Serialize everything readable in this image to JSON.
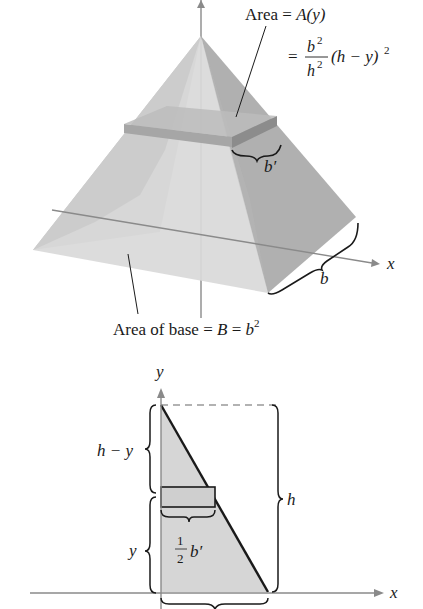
{
  "figure": {
    "top_diagram": {
      "title": "Square pyramid with cross-section slice",
      "area_label": "Area = A(y)",
      "area_label_prefix": "Area = ",
      "area_label_func": "A(y)",
      "formula_eq": "=",
      "formula_num": "b",
      "formula_num_exp": "2",
      "formula_den": "h",
      "formula_den_exp": "2",
      "formula_tail": "(h − y)",
      "formula_tail_exp": "2",
      "slice_width_label": "b′",
      "base_width_label": "b",
      "x_axis_label": "x",
      "base_label_prefix": "Area of base = ",
      "base_label_B": "B",
      "base_label_eq": " = ",
      "base_label_b": "b",
      "base_label_exp": "2"
    },
    "bottom_diagram": {
      "title": "Cross-sectional triangle",
      "y_axis_label": "y",
      "x_axis_label": "x",
      "upper_height_label": "h − y",
      "lower_height_label": "y",
      "total_height_label": "h",
      "half_width_num": "1",
      "half_width_den": "2",
      "half_width_var": "b′"
    },
    "colors": {
      "face_light": "#d9d9d9",
      "face_mid": "#bdbdbd",
      "face_dark": "#a9a9a9",
      "slab": "#9a9a9a",
      "axis": "#8a8a8a",
      "ink": "#1a1a1a",
      "triangle_fill": "#d6d6d6"
    }
  }
}
